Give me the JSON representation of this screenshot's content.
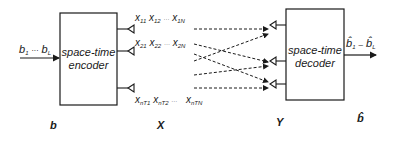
{
  "encoder": {
    "line1": "space-time",
    "line2": "encoder"
  },
  "decoder": {
    "line1": "space-time",
    "line2": "decoder"
  },
  "input": {
    "b_first": "b",
    "b_first_sub": "1",
    "dots": "···",
    "b_last": "b",
    "b_last_sub": "L"
  },
  "output": {
    "b_first": "b̂",
    "b_first_sub": "1",
    "dots": "–",
    "b_last": "b̂",
    "b_last_sub": "L"
  },
  "tx_rows": [
    {
      "x1": "x",
      "s1": "11",
      "x2": "x",
      "s2": "12",
      "dots": "···",
      "x3": "x",
      "s3": "1N"
    },
    {
      "x1": "x",
      "s1": "21",
      "x2": "x",
      "s2": "22",
      "dots": "···",
      "x3": "x",
      "s3": "2N"
    },
    {
      "x1": "x",
      "s1": "nT1",
      "x2": "x",
      "s2": "nT2",
      "dots": "···",
      "x3": "x",
      "s3": "nTN"
    }
  ],
  "bottom_labels": {
    "b": "b",
    "X": "X",
    "Y": "Y",
    "b_hat": "b̂"
  }
}
